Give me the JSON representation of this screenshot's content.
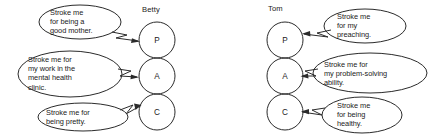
{
  "figure": {
    "type": "transactional-analysis-ego-state-diagram",
    "background_color": "#ffffff",
    "ink_color": "#2b2b2b"
  },
  "people": [
    {
      "name": "Betty",
      "side": "left",
      "ego_states": [
        {
          "code": "P",
          "name": "Parent"
        },
        {
          "code": "A",
          "name": "Adult"
        },
        {
          "code": "C",
          "name": "Child"
        }
      ]
    },
    {
      "name": "Tom",
      "side": "right",
      "ego_states": [
        {
          "code": "P",
          "name": "Parent"
        },
        {
          "code": "A",
          "name": "Adult"
        },
        {
          "code": "C",
          "name": "Child"
        }
      ]
    }
  ],
  "balloons": {
    "betty_parent": "Stroke me\nfor being a\ngood mother.",
    "betty_adult": "Stroke me for\nmy work in the\nmental health\nclinic.",
    "betty_child": "Stroke me for\nbeing pretty.",
    "tom_parent": "Stroke me\nfor my\npreaching.",
    "tom_adult": "Stroke me for\nmy problem-solving\nability.",
    "tom_child": "Stroke me\nfor being\nhealthy."
  }
}
